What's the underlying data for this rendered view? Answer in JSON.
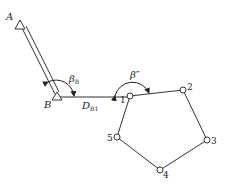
{
  "diagram": {
    "type": "traverse-survey",
    "labels": {
      "A": "A",
      "B": "B",
      "beta_B": "β",
      "beta_B_sub": "B",
      "beta_prime": "β″",
      "D": "D",
      "D_sub": "B1"
    },
    "stations": [
      {
        "id": "1",
        "label": "1"
      },
      {
        "id": "2",
        "label": "2"
      },
      {
        "id": "3",
        "label": "3"
      },
      {
        "id": "4",
        "label": "4"
      },
      {
        "id": "5",
        "label": "5"
      }
    ],
    "colors": {
      "line": "#333333",
      "background": "#ffffff"
    }
  }
}
